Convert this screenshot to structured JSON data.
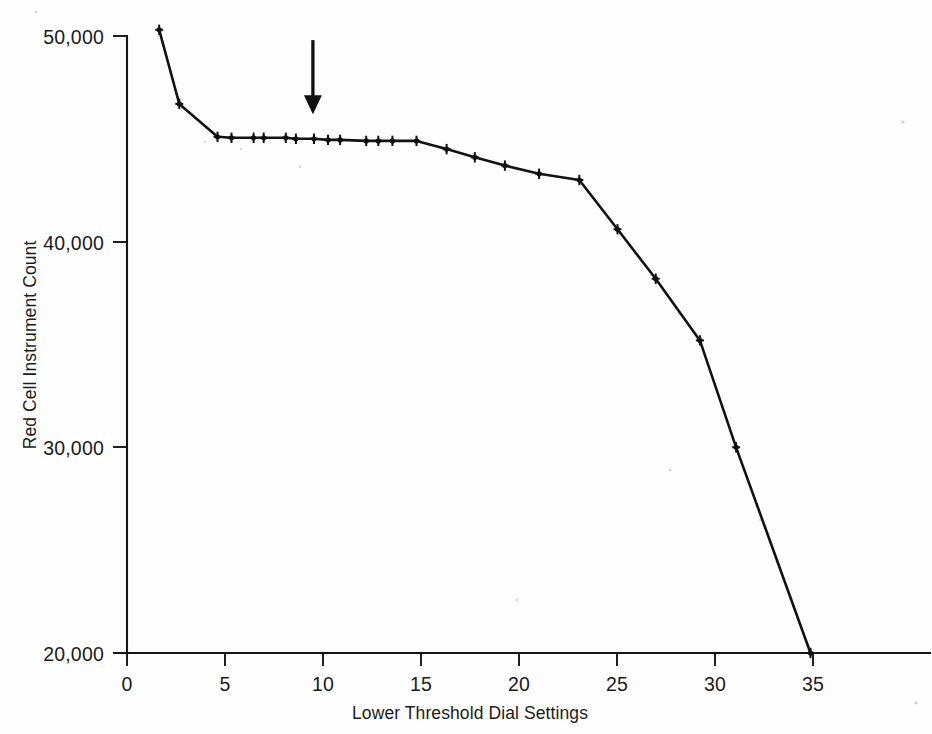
{
  "chart_data": {
    "type": "line",
    "title": "",
    "xlabel": "Lower Threshold Dial Settings",
    "ylabel": "Red Cell Instrument Count",
    "xlim": [
      0,
      39
    ],
    "ylim": [
      20000,
      50000
    ],
    "grid": false,
    "legend_position": "none",
    "xticks": [
      0,
      5,
      10,
      15,
      20,
      25,
      30,
      35
    ],
    "xtick_labels": [
      "0",
      "5",
      "10",
      "15",
      "20",
      "25",
      "30",
      "35"
    ],
    "yticks": [
      20000,
      30000,
      40000,
      50000
    ],
    "ytick_labels": [
      "20,000",
      "30,000",
      "40,000",
      "50,000"
    ],
    "series": [
      {
        "name": "Red Cell Instrument Count",
        "marker": "bowtie",
        "color": "#101010",
        "x": [
          1.6,
          2.6,
          4.5,
          5.2,
          6.3,
          6.8,
          7.9,
          8.4,
          9.3,
          10.0,
          10.6,
          11.9,
          12.5,
          13.2,
          14.4,
          15.9,
          17.3,
          18.8,
          20.5,
          22.5,
          24.4,
          26.3,
          28.5,
          30.3,
          34.0
        ],
        "y": [
          50300,
          46700,
          45100,
          45050,
          45050,
          45050,
          45050,
          45000,
          45000,
          44950,
          44950,
          44900,
          44900,
          44900,
          44900,
          44500,
          44100,
          43700,
          43300,
          43000,
          40600,
          38200,
          35200,
          30000,
          20000
        ]
      }
    ],
    "annotations": [
      {
        "type": "down-arrow",
        "x": 9.25,
        "y_top": 49800,
        "y_tip": 46200,
        "label": ""
      }
    ]
  },
  "axis_titles": {
    "x": "Lower Threshold Dial Settings",
    "y": "Red Cell Instrument Count"
  }
}
